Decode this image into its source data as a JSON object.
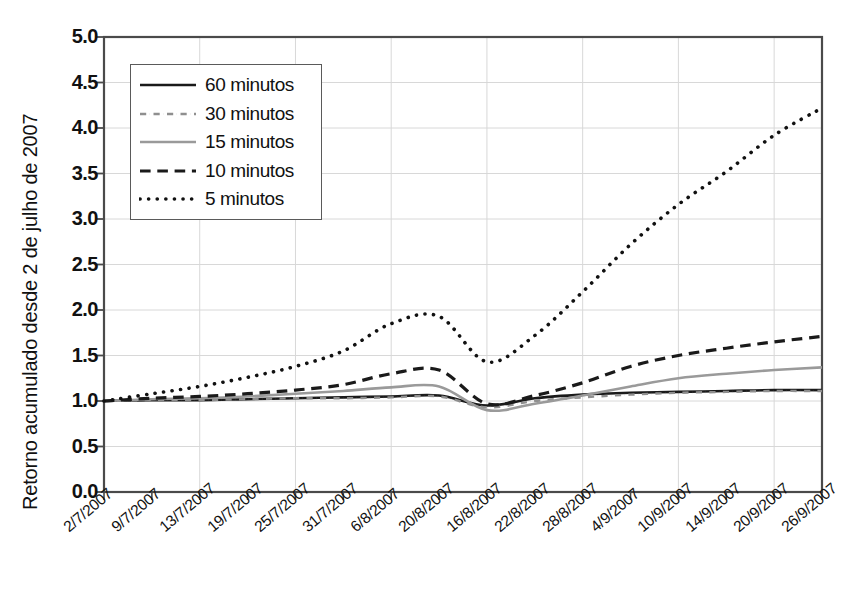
{
  "chart_data": {
    "type": "line",
    "title": "",
    "subtitle": "",
    "xlabel": "",
    "ylabel": "Retorno acumulado desde 2 de julho de 2007",
    "ylim": [
      0.0,
      5.0
    ],
    "ytick_labels": [
      "5.0",
      "4.5",
      "4.0",
      "3.5",
      "3.0",
      "2.5",
      "2.0",
      "1.5",
      "1.0",
      "0.5",
      "0.0"
    ],
    "ytick_values": [
      5.0,
      4.5,
      4.0,
      3.5,
      3.0,
      2.5,
      2.0,
      1.5,
      1.0,
      0.5,
      0.0
    ],
    "grid": "both-light",
    "legend_position": "upper-left",
    "categories": [
      "2/7/2007",
      "9/7/2007",
      "13/7/2007",
      "19/7/2007",
      "25/7/2007",
      "31/7/2007",
      "6/8/2007",
      "20/8/2007",
      "16/8/2007",
      "22/8/2007",
      "28/8/2007",
      "4/9/2007",
      "10/9/2007",
      "14/9/2007",
      "20/9/2007",
      "26/9/2007"
    ],
    "series": [
      {
        "name": "60 minutos",
        "style": "solid",
        "color": "#1a1a1a",
        "width": 2.6,
        "values": [
          1.0,
          1.01,
          1.01,
          1.02,
          1.03,
          1.04,
          1.05,
          1.06,
          0.95,
          1.03,
          1.07,
          1.09,
          1.1,
          1.11,
          1.12,
          1.12
        ]
      },
      {
        "name": "30 minutos",
        "style": "dashdot",
        "color": "#8f8f8f",
        "width": 2.4,
        "values": [
          1.0,
          1.01,
          1.01,
          1.02,
          1.03,
          1.03,
          1.04,
          1.05,
          0.93,
          1.0,
          1.04,
          1.07,
          1.09,
          1.1,
          1.11,
          1.11
        ]
      },
      {
        "name": "15 minutos",
        "style": "solid",
        "color": "#9a9a9a",
        "width": 2.6,
        "values": [
          1.0,
          1.02,
          1.03,
          1.05,
          1.08,
          1.11,
          1.15,
          1.16,
          0.9,
          0.97,
          1.06,
          1.16,
          1.25,
          1.3,
          1.34,
          1.37
        ]
      },
      {
        "name": "10 minutos",
        "style": "dashed",
        "color": "#1a1a1a",
        "width": 3.2,
        "values": [
          1.0,
          1.03,
          1.05,
          1.08,
          1.12,
          1.18,
          1.3,
          1.34,
          0.97,
          1.06,
          1.2,
          1.38,
          1.5,
          1.58,
          1.65,
          1.71
        ]
      },
      {
        "name": "5 minutos",
        "style": "dotted",
        "color": "#111111",
        "width": 3.6,
        "values": [
          1.0,
          1.08,
          1.16,
          1.26,
          1.38,
          1.55,
          1.85,
          1.93,
          1.43,
          1.72,
          2.2,
          2.72,
          3.16,
          3.52,
          3.92,
          4.22
        ]
      }
    ]
  },
  "legend": {
    "items": [
      {
        "label": "60 minutos"
      },
      {
        "label": "30 minutos"
      },
      {
        "label": "15 minutos"
      },
      {
        "label": "10 minutos"
      },
      {
        "label": "5 minutos"
      }
    ]
  },
  "axes": {
    "y_title": "Retorno acumulado desde 2 de julho de 2007"
  },
  "colors": {
    "black": "#1a1a1a",
    "gray": "#9a9a9a",
    "grid": "#d8d8d8",
    "frame": "#4a4a4a",
    "background": "#ffffff"
  }
}
